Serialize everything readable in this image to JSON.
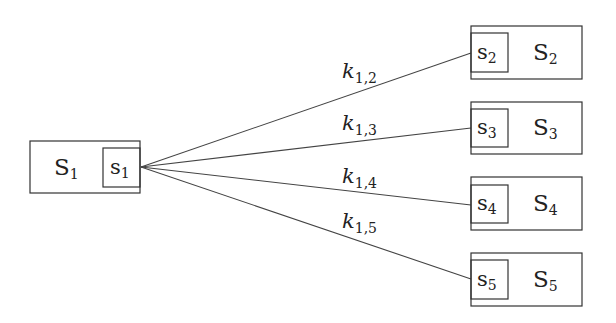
{
  "diagram": {
    "source": {
      "outer_label": "S",
      "outer_sub": "1",
      "inner_label": "s",
      "inner_sub": "1"
    },
    "targets": [
      {
        "outer_label": "S",
        "outer_sub": "2",
        "inner_label": "s",
        "inner_sub": "2",
        "edge_label": "k",
        "edge_sub": "1,2"
      },
      {
        "outer_label": "S",
        "outer_sub": "3",
        "inner_label": "s",
        "inner_sub": "3",
        "edge_label": "k",
        "edge_sub": "1,3"
      },
      {
        "outer_label": "S",
        "outer_sub": "4",
        "inner_label": "s",
        "inner_sub": "4",
        "edge_label": "k",
        "edge_sub": "1,4"
      },
      {
        "outer_label": "S",
        "outer_sub": "5",
        "inner_label": "s",
        "inner_sub": "5",
        "edge_label": "k",
        "edge_sub": "1,5"
      }
    ],
    "colors": {
      "stroke": "#333333",
      "text": "#222222",
      "background": "#ffffff"
    }
  }
}
